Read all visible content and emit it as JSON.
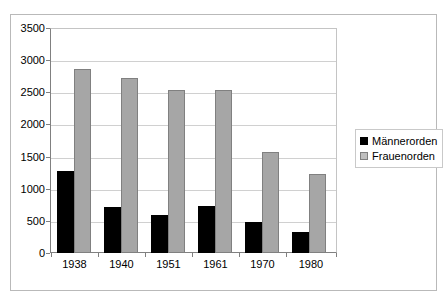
{
  "chart_data": {
    "type": "bar",
    "title": "",
    "subtitle": "",
    "xlabel": "",
    "ylabel": "",
    "categories": [
      "1938",
      "1940",
      "1951",
      "1961",
      "1970",
      "1980"
    ],
    "series": [
      {
        "name": "Männerorden",
        "color": "#000000",
        "values": [
          1280,
          720,
          590,
          730,
          490,
          330
        ]
      },
      {
        "name": "Frauenorden",
        "color": "#a6a6a6",
        "values": [
          2880,
          2740,
          2540,
          2550,
          1580,
          1240
        ]
      }
    ],
    "ylim": [
      0,
      3500
    ],
    "ytick_step": 500,
    "yticks": [
      "0",
      "500",
      "1000",
      "1500",
      "2000",
      "2500",
      "3000",
      "3500"
    ],
    "grid": true,
    "grid_axis": "y",
    "legend_position": "right"
  },
  "legend": {
    "items": [
      {
        "label": "Männerorden"
      },
      {
        "label": "Frauenorden"
      }
    ]
  }
}
